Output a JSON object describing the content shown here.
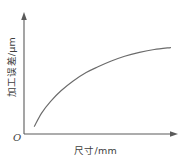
{
  "chart_data": {
    "type": "line",
    "title": "",
    "subtitle": "",
    "xlabel": "尺寸/mm",
    "ylabel": "加工误差/μm",
    "origin_label": "O",
    "grid": false,
    "legend": null,
    "axis_style": "arrow-terminated",
    "xlim": [
      0,
      1
    ],
    "ylim": [
      0,
      1
    ],
    "x_tick_labels": [],
    "y_tick_labels": [],
    "annotations": [],
    "series": [
      {
        "name": "加工误差曲线",
        "shape": "concave-increasing-saturating",
        "color": "#6b6b6b",
        "x": [
          0.07,
          0.12,
          0.18,
          0.25,
          0.33,
          0.42,
          0.5,
          0.59,
          0.68,
          0.78,
          0.88,
          0.99
        ],
        "y": [
          0.08,
          0.22,
          0.34,
          0.45,
          0.55,
          0.64,
          0.7,
          0.76,
          0.81,
          0.85,
          0.88,
          0.9
        ]
      }
    ]
  },
  "axes": {
    "x_axis_name": "尺寸轴",
    "y_axis_name": "加工误差轴",
    "axis_color": "#5a5a5a"
  },
  "figure": {
    "background": "#ffffff"
  }
}
